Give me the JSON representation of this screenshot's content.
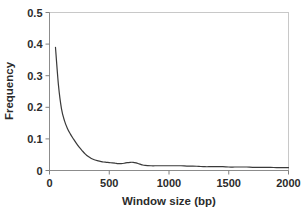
{
  "chart_data": {
    "type": "line",
    "title": "",
    "xlabel": "Window size (bp)",
    "ylabel": "Frequency",
    "xlim": [
      0,
      2000
    ],
    "ylim": [
      0,
      0.5
    ],
    "xticks": [
      0,
      500,
      1000,
      1500,
      2000
    ],
    "xtick_labels": [
      "0",
      "500",
      "1000",
      "1500",
      "2000"
    ],
    "yticks": [
      0,
      0.1,
      0.2,
      0.3,
      0.4,
      0.5
    ],
    "ytick_labels": [
      "0",
      "0.1",
      "0.2",
      "0.3",
      "0.4",
      "0.5"
    ],
    "grid": false,
    "legend": null,
    "legend_position": "none",
    "series": [
      {
        "name": "Frequency",
        "color": "#3a3a3a",
        "x": [
          50,
          75,
          100,
          125,
          150,
          175,
          200,
          225,
          250,
          275,
          300,
          325,
          350,
          375,
          400,
          425,
          450,
          475,
          500,
          525,
          550,
          575,
          600,
          625,
          650,
          675,
          700,
          725,
          750,
          775,
          800,
          850,
          900,
          950,
          1000,
          1050,
          1100,
          1150,
          1200,
          1250,
          1300,
          1350,
          1400,
          1450,
          1500,
          1550,
          1600,
          1650,
          1700,
          1750,
          1800,
          1850,
          1900,
          1950,
          2000
        ],
        "values": [
          0.39,
          0.27,
          0.196,
          0.158,
          0.133,
          0.115,
          0.1,
          0.086,
          0.073,
          0.062,
          0.052,
          0.044,
          0.038,
          0.034,
          0.031,
          0.029,
          0.027,
          0.026,
          0.025,
          0.024,
          0.023,
          0.022,
          0.022,
          0.023,
          0.025,
          0.026,
          0.026,
          0.024,
          0.021,
          0.018,
          0.016,
          0.015,
          0.015,
          0.015,
          0.015,
          0.015,
          0.015,
          0.014,
          0.014,
          0.013,
          0.012,
          0.012,
          0.012,
          0.012,
          0.011,
          0.011,
          0.011,
          0.011,
          0.01,
          0.01,
          0.01,
          0.01,
          0.009,
          0.009,
          0.009
        ]
      }
    ]
  },
  "axes": {
    "x_title": "Window size (bp)",
    "y_title": "Frequency",
    "x_tick_labels": [
      "0",
      "500",
      "1000",
      "1500",
      "2000"
    ],
    "y_tick_labels": [
      "0",
      "0.1",
      "0.2",
      "0.3",
      "0.4",
      "0.5"
    ]
  },
  "colors": {
    "line": "#3a3a3a",
    "axis": "#808080",
    "plot_border": "#c8c8c8",
    "text": "#2b2b2b",
    "background": "#ffffff"
  }
}
